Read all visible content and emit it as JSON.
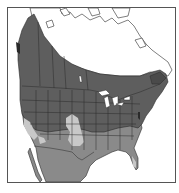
{
  "map": {
    "type": "species-range-map",
    "region": "North America",
    "legend": [],
    "colors": {
      "background": "#ffffff",
      "frame": "#555555",
      "land_outside_range": "#ffffff",
      "primary_range": "#5e5e5e",
      "secondary_range": "#8a8a8a",
      "light_range": "#c8c8c8",
      "borders": "#2a2a2a",
      "water": "#ffffff"
    },
    "zones": [
      {
        "name": "primary-range",
        "shade": "dark gray",
        "area": "Southern Canada, Alaska panhandle, most of contiguous US"
      },
      {
        "name": "secondary-range",
        "shade": "medium gray",
        "area": "Mexico, Texas, southern US, southwest, Florida"
      },
      {
        "name": "light-range",
        "shade": "light gray",
        "area": "California / Nevada interior, Colorado–Kansas–Oklahoma plains, south Florida tip"
      },
      {
        "name": "outside-range",
        "shade": "white",
        "area": "Northern Canada and Arctic islands"
      }
    ]
  }
}
